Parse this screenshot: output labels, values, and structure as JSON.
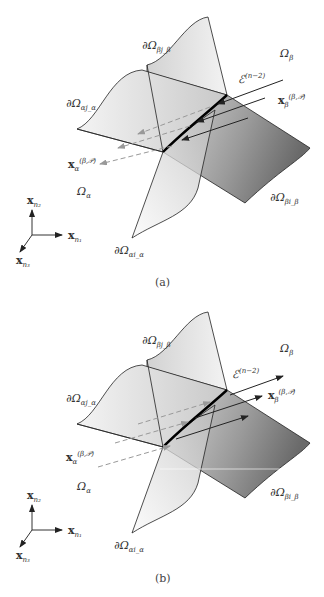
{
  "figure": {
    "panels": [
      {
        "id": "a",
        "caption": "(a)",
        "arrow_direction": "from β into α",
        "labels": {
          "boundary_beta_top": "∂Ω",
          "boundary_beta_top_sub": "βj_β",
          "omega_beta": "Ω",
          "omega_beta_sub": "β",
          "edge": "ℰ",
          "edge_sup": "(n−2)",
          "flow_beta": "x",
          "flow_beta_sub": "β",
          "flow_beta_sup": "(β,𝒫)",
          "boundary_alpha_left": "∂Ω",
          "boundary_alpha_left_sub": "αj_α",
          "flow_alpha": "x",
          "flow_alpha_sub": "α",
          "flow_alpha_sup": "(β,𝒫)",
          "omega_alpha": "Ω",
          "omega_alpha_sub": "α",
          "boundary_beta_right": "∂Ω",
          "boundary_beta_right_sub": "βi_β",
          "boundary_alpha_bottom": "∂Ω",
          "boundary_alpha_bottom_sub": "αi_α"
        }
      },
      {
        "id": "b",
        "caption": "(b)",
        "arrow_direction": "from α into β",
        "labels": {
          "boundary_beta_top": "∂Ω",
          "boundary_beta_top_sub": "βj_β",
          "omega_beta": "Ω",
          "omega_beta_sub": "β",
          "edge": "ℰ",
          "edge_sup": "(n−2)",
          "flow_beta": "x",
          "flow_beta_sub": "β",
          "flow_beta_sup": "(β,𝒫)",
          "boundary_alpha_left": "∂Ω",
          "boundary_alpha_left_sub": "αj_α",
          "flow_alpha": "x",
          "flow_alpha_sub": "α",
          "flow_alpha_sup": "(β,𝒫)",
          "omega_alpha": "Ω",
          "omega_alpha_sub": "α",
          "boundary_beta_right": "∂Ω",
          "boundary_beta_right_sub": "βi_β",
          "boundary_alpha_bottom": "∂Ω",
          "boundary_alpha_bottom_sub": "αi_α"
        }
      }
    ],
    "axes": {
      "x1": "x",
      "x1_sub": "n₁",
      "x2": "x",
      "x2_sub": "n₂",
      "x3": "x",
      "x3_sub": "n₃"
    },
    "colors": {
      "line": "#222222",
      "dashed": "#999999",
      "surface_light": "#e8e8e8",
      "surface_dark": "#6e6e6e"
    }
  }
}
